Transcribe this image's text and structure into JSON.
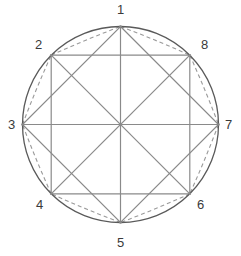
{
  "figure": {
    "background_color": "#ffffff",
    "circle": {
      "name": "outer-circle",
      "center_x": 120.5,
      "center_y": 124.5,
      "radius": 98,
      "stroke_color": "#5a5a5a",
      "stroke_width": 1.3,
      "fill": "none"
    },
    "geometry": {
      "vertex_count": 8,
      "start_angle_degrees": -90,
      "angle_step_degrees": 45,
      "label_font_size": 13,
      "label_color": "#3a3a3a"
    },
    "line_styles": {
      "chord_color": "#8a8a8a",
      "chord_width": 1.2,
      "diameter_color": "#8a8a8a",
      "diameter_width": 1.2,
      "dashed_color": "#9a9a9a",
      "dashed_width": 1.1,
      "dash_pattern": "4 3"
    },
    "vertices": [
      {
        "id": 1,
        "label": "1",
        "angle_degrees": -90,
        "x": 120.5,
        "y": 26.5,
        "label_x": 117,
        "label_y": 3,
        "label_align": "center"
      },
      {
        "id": 2,
        "label": "2",
        "angle_degrees": -45,
        "x": 189.8,
        "y": 55.2,
        "label_x": 35,
        "label_y": 38,
        "label_align": "left"
      },
      {
        "id": 3,
        "label": "3",
        "angle_degrees": 0,
        "x": 218.5,
        "y": 124.5,
        "label_x": 8,
        "label_y": 118,
        "label_align": "left"
      },
      {
        "id": 4,
        "label": "4",
        "angle_degrees": 45,
        "x": 189.8,
        "y": 193.8,
        "label_x": 36,
        "label_y": 198,
        "label_align": "left"
      },
      {
        "id": 5,
        "label": "5",
        "angle_degrees": 90,
        "x": 120.5,
        "y": 222.5,
        "label_x": 117,
        "label_y": 236,
        "label_align": "center"
      },
      {
        "id": 6,
        "label": "6",
        "angle_degrees": 135,
        "x": 51.2,
        "y": 193.8,
        "label_x": 197,
        "label_y": 198,
        "label_align": "left"
      },
      {
        "id": 7,
        "label": "7",
        "angle_degrees": 180,
        "x": 22.5,
        "y": 124.5,
        "label_x": 225,
        "label_y": 118,
        "label_align": "left"
      },
      {
        "id": 8,
        "label": "8",
        "angle_degrees": 225,
        "x": 51.2,
        "y": 55.2,
        "label_x": 201,
        "label_y": 38,
        "label_align": "left"
      }
    ],
    "shapes": [
      {
        "name": "axis-aligned-square",
        "vertex_ids": [
          2,
          4,
          6,
          8
        ],
        "style": "solid"
      },
      {
        "name": "rotated-square",
        "vertex_ids": [
          1,
          3,
          5,
          7
        ],
        "style": "solid"
      },
      {
        "name": "diameter-1-5",
        "vertex_ids": [
          1,
          5
        ],
        "style": "solid"
      },
      {
        "name": "diameter-2-6",
        "vertex_ids": [
          2,
          6
        ],
        "style": "solid"
      },
      {
        "name": "diameter-3-7",
        "vertex_ids": [
          3,
          7
        ],
        "style": "solid"
      },
      {
        "name": "diameter-4-8",
        "vertex_ids": [
          4,
          8
        ],
        "style": "solid"
      }
    ],
    "dashed_arcs": [
      {
        "name": "dashed-arc-1-2",
        "from": 1,
        "to": 2
      },
      {
        "name": "dashed-arc-2-3",
        "from": 2,
        "to": 3
      },
      {
        "name": "dashed-arc-3-4",
        "from": 3,
        "to": 4
      },
      {
        "name": "dashed-arc-4-5",
        "from": 4,
        "to": 5
      },
      {
        "name": "dashed-arc-5-6",
        "from": 5,
        "to": 6
      },
      {
        "name": "dashed-arc-6-7",
        "from": 6,
        "to": 7
      },
      {
        "name": "dashed-arc-7-8",
        "from": 7,
        "to": 8
      },
      {
        "name": "dashed-arc-8-1",
        "from": 8,
        "to": 1
      }
    ]
  }
}
